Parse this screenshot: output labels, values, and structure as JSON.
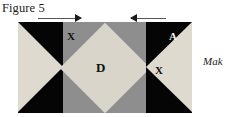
{
  "figure": {
    "title": "Figure 5"
  },
  "arrows": [
    {
      "name": "arrow-right",
      "direction": "right"
    },
    {
      "name": "arrow-left",
      "direction": "left"
    }
  ],
  "diagram": {
    "labels": {
      "x_top_left": "X",
      "center": "D",
      "x_right": "X",
      "a_top_right": "A"
    },
    "colors": {
      "background_dark": "#050505",
      "panel_gray": "#8e8e8e",
      "patch_light": "#dedad0",
      "diamond_light": "#d9d5cb"
    }
  },
  "side_text": {
    "value": "Mak"
  }
}
